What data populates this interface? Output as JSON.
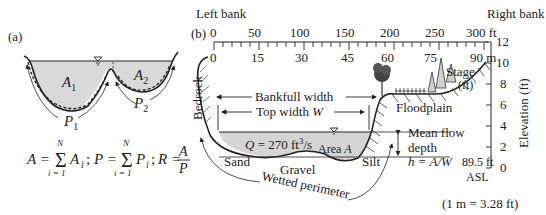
{
  "panel_a": {
    "label": "(a)",
    "area_labels": [
      "A",
      "A"
    ],
    "area_subs": [
      "1",
      "2"
    ],
    "perimeter_labels": [
      "P",
      "P"
    ],
    "perimeter_subs": [
      "1",
      "2"
    ],
    "formula": {
      "A_lhs": "A =",
      "A_sum": "A",
      "A_sub": "i",
      "sep1": ";",
      "P_lhs": "P =",
      "P_sum": "P",
      "P_sub": "i",
      "sep2": ";",
      "R_lhs": "R =",
      "R_num": "A",
      "R_den": "P",
      "sum_upper": "N",
      "sum_lower": "i = 1"
    },
    "colors": {
      "water": "#d9d9d9",
      "line": "#222222"
    }
  },
  "panel_b": {
    "label": "(b)",
    "left_bank": "Left bank",
    "right_bank": "Right bank",
    "ft_scale": {
      "ticks": [
        "0",
        "50",
        "100",
        "150",
        "200",
        "250",
        "300 ft"
      ]
    },
    "m_scale": {
      "ticks": [
        "0",
        "15",
        "30",
        "45",
        "60",
        "75",
        "90 m"
      ]
    },
    "elevation_axis": {
      "title": "Elevation (ft)",
      "ticks": [
        "12",
        "10",
        "8",
        "6",
        "4",
        "2",
        "0"
      ]
    },
    "labels": {
      "bedrock": "Bedrock",
      "bankfull_width": "Bankfull width",
      "top_width": "Top width ",
      "top_width_var": "W",
      "discharge_prefix": "Q",
      "discharge": " = 270 ft",
      "discharge_sup": "3",
      "discharge_unit": "/s",
      "area": "Area ",
      "area_var": "A",
      "sand": "Sand",
      "gravel": "Gravel",
      "silt": "Silt",
      "wetted_perimeter": "Wetted perimeter",
      "floodplain": "Floodplain",
      "mean_flow": "Mean flow",
      "depth": "depth",
      "depth_formula": "h = A/W",
      "stage": "Stage",
      "stage_unit": "(ft)",
      "datum": "89.5 ft",
      "asl": "ASL",
      "conversion": "(1 m = 3.28 ft)"
    },
    "colors": {
      "water": "#d4d4d4",
      "tree": "#444444",
      "line": "#222222"
    }
  }
}
